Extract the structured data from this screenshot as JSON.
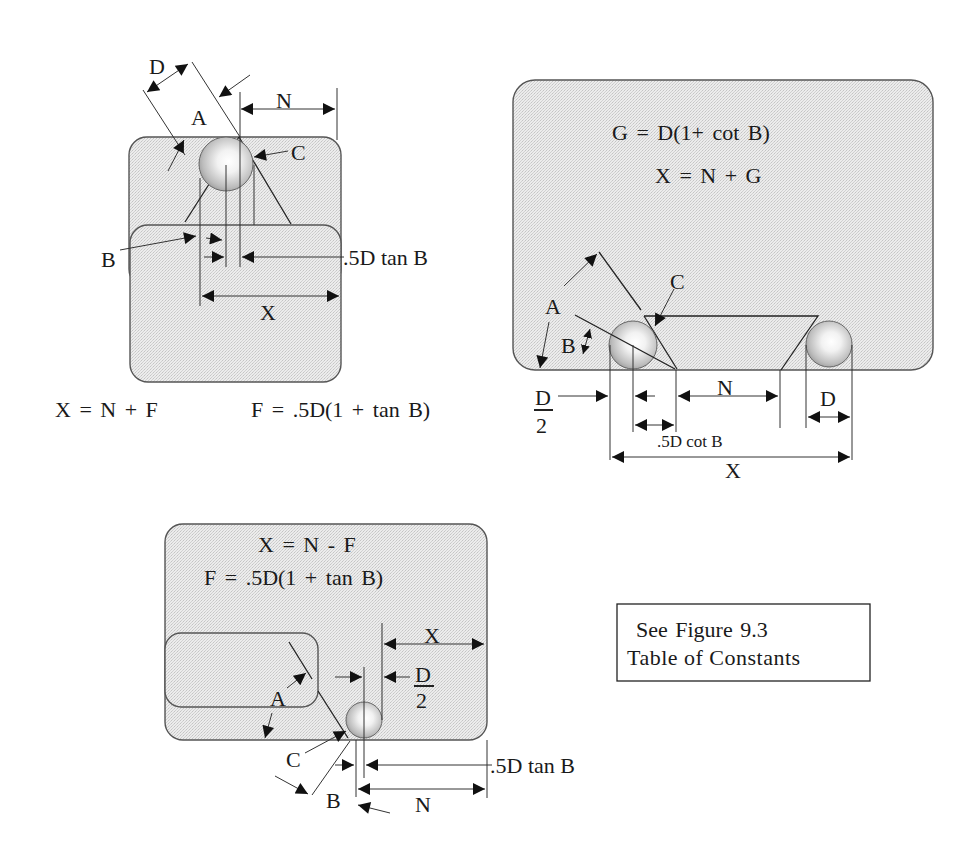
{
  "figure": {
    "diagram_1": {
      "labels": {
        "D": "D",
        "A": "A",
        "N": "N",
        "C": "C",
        "B": "B",
        "half_d_tan_b": ".5D tan B",
        "X": "X"
      },
      "formulas": {
        "x_eq": "X = N + F",
        "f_eq": "F = .5D(1 + tan B)"
      }
    },
    "diagram_2": {
      "formulas": {
        "g_eq": "G = D(1+ cot B)",
        "x_eq": "X = N + G"
      },
      "labels": {
        "A": "A",
        "B": "B",
        "C": "C",
        "D_num": "D",
        "D_den": "2",
        "N": "N",
        "D": "D",
        "half_d_cot_b": ".5D cot B",
        "X": "X"
      }
    },
    "diagram_3": {
      "formulas": {
        "x_eq": "X = N - F",
        "f_eq": "F = .5D(1 + tan B)"
      },
      "labels": {
        "X": "X",
        "D_num": "D",
        "D_den": "2",
        "A": "A",
        "C": "C",
        "B": "B",
        "N": "N",
        "half_d_tan_b": ".5D tan B"
      }
    },
    "note_box": {
      "line1": "See Figure  9.3",
      "line2": "Table of Constants"
    }
  }
}
